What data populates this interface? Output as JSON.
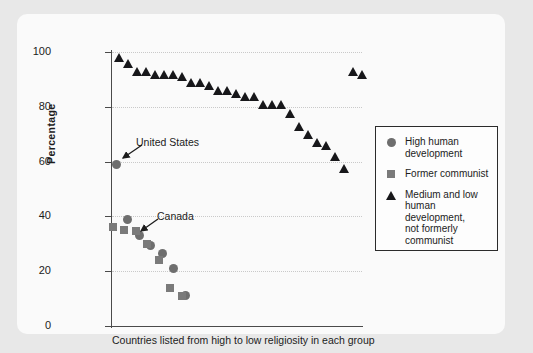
{
  "chart_data": {
    "type": "scatter",
    "title": "",
    "xlabel": "Countries listed from high to low religiosity in each group",
    "ylabel": "Percentage",
    "ylim": [
      0,
      100
    ],
    "yticks": [
      0,
      20,
      40,
      60,
      80,
      100
    ],
    "xlim_note": "Countries ordered by religiosity within each group; no x tick labels",
    "grid": "horizontal dotted gridlines at 20, 40, 60, 80, 100",
    "legend_position": "right, outside plot, boxed",
    "series": [
      {
        "name": "High human development",
        "marker": "circle",
        "color": "#6e6e6e",
        "x": [
          1,
          2,
          3,
          4,
          5,
          6,
          7
        ],
        "values": [
          59,
          39,
          33,
          29.5,
          26.5,
          21,
          11
        ]
      },
      {
        "name": "Former communist",
        "marker": "square",
        "color": "#7a7a7a",
        "x": [
          1,
          2,
          3,
          4,
          5,
          6,
          7
        ],
        "values": [
          36,
          35,
          34.5,
          30,
          24,
          14,
          11
        ]
      },
      {
        "name": "Medium and low human development, not formerly communist",
        "marker": "triangle",
        "color": "#17171a",
        "x": [
          1,
          2,
          3,
          4,
          5,
          6,
          7,
          8,
          9,
          10,
          11,
          12,
          13,
          14,
          15,
          16,
          17,
          18,
          19,
          20,
          21,
          22,
          23,
          24,
          25,
          26,
          27,
          28
        ],
        "values": [
          97,
          95,
          92,
          92,
          91,
          91,
          91,
          90,
          88,
          88,
          87,
          85,
          85,
          84,
          83,
          83,
          80,
          80,
          80,
          76.5,
          72,
          69,
          66,
          65,
          61,
          56.5,
          92,
          91
        ]
      }
    ],
    "annotations": [
      {
        "label": "United States",
        "points_to_series": "High human development",
        "points_to_value": 59
      },
      {
        "label": "Canada",
        "points_to_series": "High human development",
        "points_to_value": 33
      }
    ]
  },
  "axis": {
    "y_title": "Percentage",
    "x_title": "Countries listed from high to low religiosity in each group",
    "y_tick_labels": [
      "100",
      "80",
      "60",
      "40",
      "20",
      "0"
    ]
  },
  "legend": {
    "items": [
      {
        "marker": "circle-marker",
        "label": "High human\ndevelopment",
        "line1": "High human",
        "line2": "development"
      },
      {
        "marker": "square-marker",
        "label": "Former communist",
        "line1": "Former communist",
        "line2": ""
      },
      {
        "marker": "triangle-marker",
        "label": "Medium and low human development, not formerly communist",
        "line1": "Medium and low",
        "line2": "human development,",
        "line3": "not formerly",
        "line4": "communist"
      }
    ]
  },
  "annotations": {
    "united_states": "United States",
    "canada": "Canada"
  },
  "colors": {
    "circle": "#6e6e6e",
    "square": "#7a7a7a",
    "triangle": "#17171a",
    "axis": "#4a4a4a",
    "grid": "#c9c9c9",
    "page_background": "#e8e8e8",
    "card_background": "#fafafa"
  }
}
